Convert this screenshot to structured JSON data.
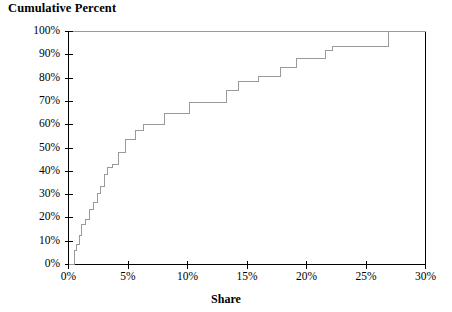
{
  "chart_data": {
    "type": "line",
    "subtype": "step",
    "title": "",
    "ylabel": "Cumulative Percent",
    "xlabel": "Share",
    "xlim": [
      0,
      30
    ],
    "ylim": [
      0,
      100
    ],
    "grid": false,
    "legend": "none",
    "xtick_labels": [
      "0%",
      "5%",
      "10%",
      "15%",
      "20%",
      "25%",
      "30%"
    ],
    "xtick_values": [
      0,
      5,
      10,
      15,
      20,
      25,
      30
    ],
    "ytick_labels": [
      "0%",
      "10%",
      "20%",
      "30%",
      "40%",
      "50%",
      "60%",
      "70%",
      "80%",
      "90%",
      "100%"
    ],
    "ytick_values": [
      0,
      10,
      20,
      30,
      40,
      50,
      60,
      70,
      80,
      90,
      100
    ],
    "series": [
      {
        "name": "Cumulative share distribution",
        "color": "#9a9a9a",
        "x": [
          0.0,
          0.5,
          0.5,
          0.7,
          0.7,
          0.9,
          0.9,
          1.1,
          1.1,
          1.4,
          1.4,
          1.8,
          1.8,
          2.1,
          2.1,
          2.4,
          2.4,
          2.7,
          2.7,
          3.0,
          3.0,
          3.3,
          3.3,
          3.7,
          3.7,
          4.2,
          4.2,
          4.8,
          4.8,
          5.6,
          5.6,
          6.3,
          6.3,
          7.2,
          7.2,
          8.1,
          8.1,
          10.2,
          10.2,
          11.6,
          11.6,
          13.3,
          13.3,
          14.3,
          14.3,
          16.0,
          16.0,
          17.8,
          17.8,
          19.2,
          19.2,
          21.6,
          21.6,
          22.2,
          22.2,
          26.9,
          26.9,
          30.0
        ],
        "y": [
          0.0,
          0.0,
          6.0,
          6.0,
          8.5,
          8.5,
          12.5,
          12.5,
          17.0,
          17.0,
          19.5,
          19.5,
          23.5,
          23.5,
          26.5,
          26.5,
          30.5,
          30.5,
          33.5,
          33.5,
          38.5,
          38.5,
          41.5,
          41.5,
          43.0,
          43.0,
          48.0,
          48.0,
          53.5,
          53.5,
          57.5,
          57.5,
          60.0,
          60.0,
          60.0,
          60.0,
          65.0,
          65.0,
          69.5,
          69.5,
          69.5,
          69.5,
          74.5,
          74.5,
          78.5,
          78.5,
          80.5,
          80.5,
          84.5,
          84.5,
          88.5,
          88.5,
          92.0,
          92.0,
          93.5,
          93.5,
          100.0,
          100.0
        ]
      }
    ],
    "axes": {
      "axis_color": "#000000",
      "line_color": "#9a9a9a",
      "background": "#ffffff"
    }
  }
}
